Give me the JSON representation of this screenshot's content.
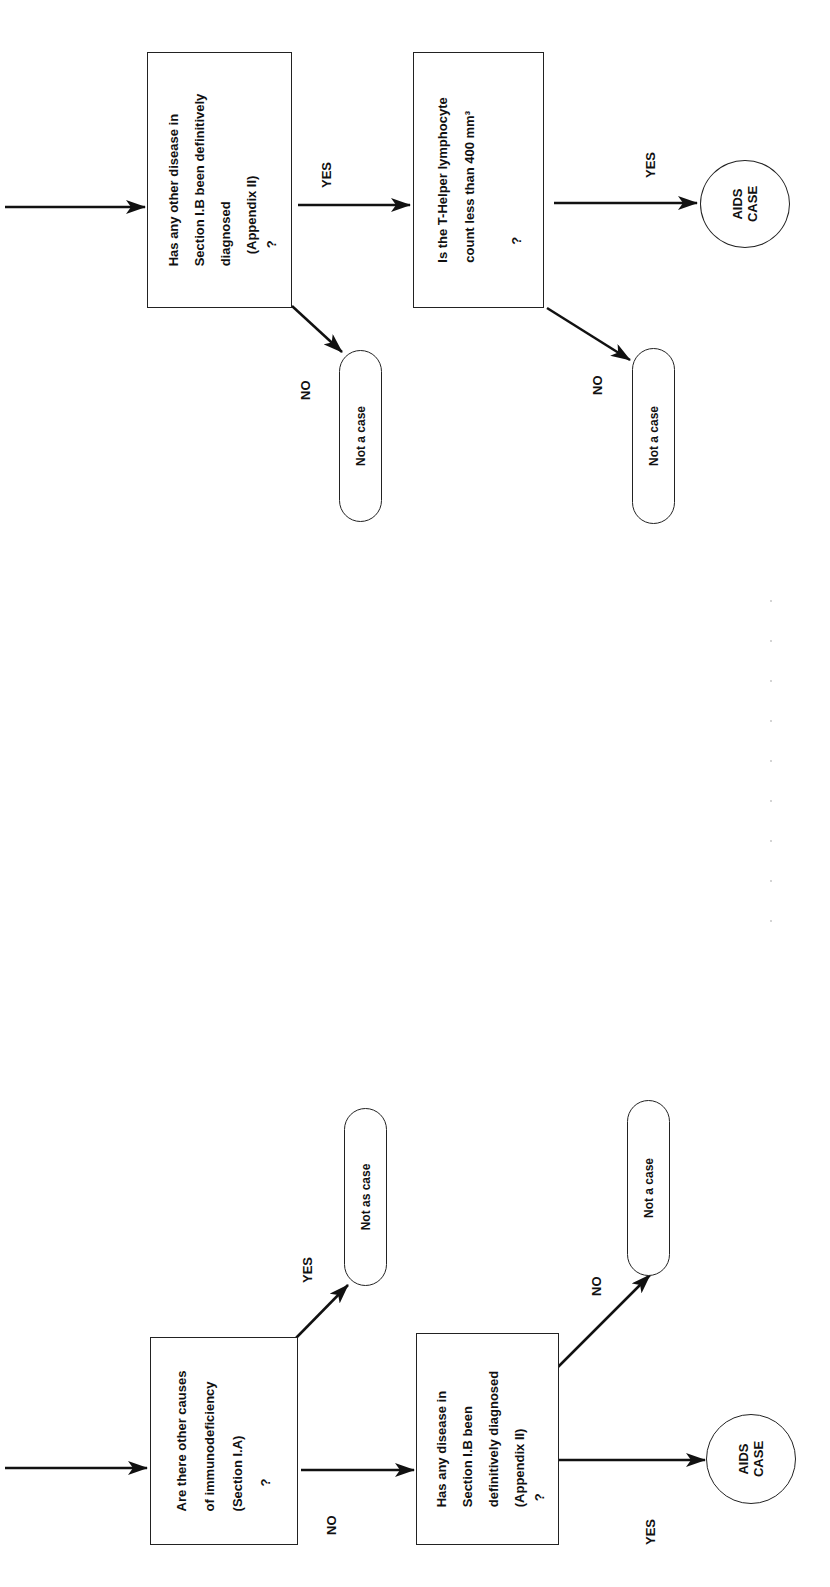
{
  "flowchart": {
    "orientation": "rotated-90-ccw",
    "questions": [
      {
        "id": "q1",
        "lines": [
          "Are there other causes",
          "of immunodeficiency",
          "(Section I.A)",
          "?"
        ]
      },
      {
        "id": "q2",
        "lines": [
          "Has any disease in",
          "Section I.B been",
          "definitively diagnosed",
          "(Appendix II)",
          "?"
        ]
      },
      {
        "id": "q3",
        "lines": [
          "Has any other disease in",
          "Section I.B been definitively",
          "diagnosed",
          "(Appendix II)",
          "?"
        ]
      },
      {
        "id": "q4",
        "lines": [
          "Is the T-Helper lymphocyte",
          "count less than 400 mm³",
          "",
          "?"
        ]
      }
    ],
    "terminals": {
      "q1_yes": "Not as case",
      "q2_no": "Not a case",
      "q3_no": "Not a case",
      "q4_no": "Not a case"
    },
    "aids_case": {
      "line1": "AIDS",
      "line2": "CASE"
    },
    "edge_labels": {
      "q1_yes": "YES",
      "q1_no": "NO",
      "q2_no": "NO",
      "q2_yes": "YES",
      "q3_yes": "YES",
      "q3_no": "NO",
      "q4_yes": "YES",
      "q4_no": "NO"
    },
    "colors": {
      "line": "#111111",
      "background": "#ffffff"
    }
  }
}
